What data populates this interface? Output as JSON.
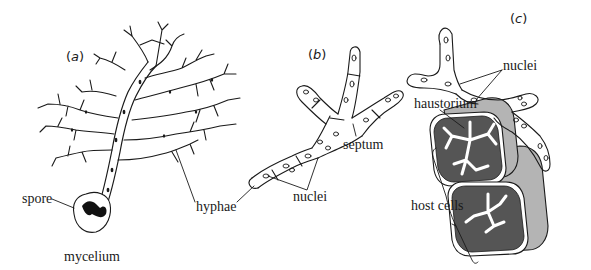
{
  "figure": {
    "panels": [
      {
        "id": "a",
        "label": "a"
      },
      {
        "id": "b",
        "label": "b"
      },
      {
        "id": "c",
        "label": "c"
      }
    ],
    "labels": {
      "spore": "spore",
      "mycelium": "mycelium",
      "hyphae": "hyphae",
      "nuclei_b": "nuclei",
      "septum": "septum",
      "nuclei_c": "nuclei",
      "haustorium": "haustorium",
      "host_cells": "host cells"
    },
    "colors": {
      "line": "#1a1a1a",
      "hyphae_fill": "#ffffff",
      "host_cell_wall": "#b4b4b4",
      "host_cell_interior": "#555555",
      "haustorium_fill": "#ffffff",
      "spore_dark": "#111111"
    }
  }
}
